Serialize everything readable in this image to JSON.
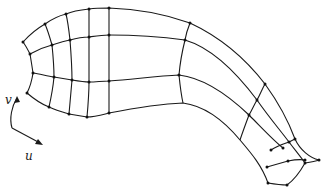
{
  "figure": {
    "axis_labels": {
      "u": "u",
      "v": "v"
    },
    "colors": {
      "stroke": "#1a1a1a",
      "background": "#ffffff"
    }
  },
  "paths": {
    "v_lines": [
      "M23,42 C32,32 38,28 45,24 C52,19 58,16 66,14 C73,11 80,10 89,9 C96,8 102,8 109,8 C140,9 165,14 190,23 C220,37 245,58 265,84 C278,102 288,120 295,139 C300,150 310,158 319,160",
      "M30,54 C37,50 44,47 52,45 C58,43 64,41 70,40 C77,38 83,37 89,37 C96,36 102,35 109,35 C140,35 163,37 185,40 C212,48 236,72 257,100 C268,116 280,130 289,142 C295,150 300,156 305,163",
      "M33,73 C40,74 47,76 54,77 C60,78 66,79 72,80 C78,81 84,82 89,82 C96,82 102,81 109,81 C135,79 158,76 179,75 C205,78 228,95 249,115 C262,128 273,140 283,148",
      "M27,93 C34,99 41,104 49,107 C55,110 62,112 69,114 C75,115 81,116 87,117 C94,117 101,115 109,113 C135,108 160,104 183,103 C206,106 225,122 240,140 C252,154 262,166 268,183"
    ],
    "u_lines": [
      "M23,42 C26,46 28,50 30,54 C31,60 32,66 33,73 C32,80 30,87 27,93",
      "M45,24 C48,31 50,38 52,45 C53,55 54,66 54,77 C53,88 51,98 49,107",
      "M66,14 C68,22 69,31 70,40 C71,53 72,67 72,80 C71,92 70,103 69,114",
      "M89,9 C89,18 89,28 89,37 C89,52 89,67 89,82 C89,94 88,106 87,117",
      "M109,8 C109,17 109,26 109,35 C109,50 109,66 109,81 C109,92 109,102 109,113",
      "M190,23 C188,28 186,34 185,40 C182,52 180,63 179,75 C180,85 181,94 183,103",
      "M265,84 C262,89 260,95 257,100 C254,105 252,110 249,115 C246,123 243,131 240,140",
      "M271,150 C277,146 283,144 289,142 C291,141 293,140 295,139",
      "M267,167 C274,165 281,163 288,161 C293,160 299,159 305,160",
      "M268,183 C274,184 281,185 287,185 C294,180 300,172 305,163 C311,162 316,161 319,160"
    ],
    "axis_arrows": {
      "v": "M12,128 C9,118 12,106 17,98",
      "u": "M12,128 L40,143"
    }
  },
  "nodes": [
    [
      23,
      42
    ],
    [
      45,
      24
    ],
    [
      66,
      14
    ],
    [
      89,
      9
    ],
    [
      109,
      8
    ],
    [
      190,
      23
    ],
    [
      265,
      84
    ],
    [
      30,
      54
    ],
    [
      52,
      45
    ],
    [
      70,
      40
    ],
    [
      89,
      37
    ],
    [
      109,
      35
    ],
    [
      185,
      40
    ],
    [
      257,
      100
    ],
    [
      33,
      73
    ],
    [
      54,
      77
    ],
    [
      72,
      80
    ],
    [
      89,
      82
    ],
    [
      109,
      81
    ],
    [
      179,
      75
    ],
    [
      249,
      115
    ],
    [
      27,
      93
    ],
    [
      49,
      107
    ],
    [
      69,
      114
    ],
    [
      87,
      117
    ],
    [
      109,
      113
    ],
    [
      295,
      139
    ],
    [
      289,
      142
    ],
    [
      283,
      148
    ],
    [
      271,
      150
    ],
    [
      305,
      160
    ],
    [
      288,
      161
    ],
    [
      267,
      167
    ],
    [
      319,
      160
    ],
    [
      305,
      163
    ],
    [
      287,
      185
    ],
    [
      268,
      183
    ]
  ]
}
